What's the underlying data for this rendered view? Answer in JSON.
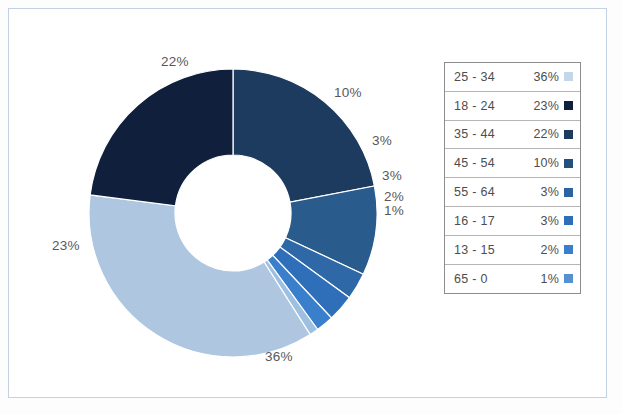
{
  "chart_data": {
    "type": "pie",
    "variant": "donut",
    "title": "",
    "subtitle": "",
    "xlabel": "",
    "ylabel": "",
    "legend_position": "right",
    "grid": false,
    "start_angle_deg": 0,
    "direction": "clockwise",
    "categories": [
      "25 - 34",
      "18 - 24",
      "35 - 44",
      "45 - 54",
      "55 - 64",
      "16 - 17",
      "13 - 15",
      "65 - 0"
    ],
    "values": [
      36,
      23,
      22,
      10,
      3,
      3,
      2,
      1
    ],
    "unit": "%",
    "draw_order": [
      "35 - 44",
      "45 - 54",
      "55 - 64",
      "16 - 17",
      "13 - 15",
      "65 - 0",
      "25 - 34",
      "18 - 24"
    ],
    "slices": [
      {
        "label": "35 - 44",
        "value": 22,
        "display": "22%",
        "color": "#1d3a5f"
      },
      {
        "label": "45 - 54",
        "value": 10,
        "display": "10%",
        "color": "#2a5b8d"
      },
      {
        "label": "55 - 64",
        "value": 3,
        "display": "3%",
        "color": "#2e68a6"
      },
      {
        "label": "16 - 17",
        "value": 3,
        "display": "3%",
        "color": "#2f6fba"
      },
      {
        "label": "13 - 15",
        "value": 2,
        "display": "2%",
        "color": "#3a7fcc"
      },
      {
        "label": "65 - 0",
        "value": 1,
        "display": "1%",
        "color": "#9dc0e2"
      },
      {
        "label": "25 - 34",
        "value": 36,
        "display": "36%",
        "color": "#aec6e0"
      },
      {
        "label": "18 - 24",
        "value": 23,
        "display": "23%",
        "color": "#101f3c"
      }
    ]
  },
  "donut": {
    "center_x": 233,
    "center_y": 213,
    "outer_radius": 144,
    "inner_radius": 58,
    "hole_color": "#ffffff",
    "separator_color": "#ffffff",
    "labels": [
      {
        "name": "label-22",
        "text": "22%",
        "x": 161,
        "y": 54
      },
      {
        "name": "label-10",
        "text": "10%",
        "x": 334,
        "y": 85
      },
      {
        "name": "label-3a",
        "text": "3%",
        "x": 372,
        "y": 133
      },
      {
        "name": "label-3b",
        "text": "3%",
        "x": 382,
        "y": 168
      },
      {
        "name": "label-2",
        "text": "2%",
        "x": 384,
        "y": 189
      },
      {
        "name": "label-1",
        "text": "1%",
        "x": 384,
        "y": 203
      },
      {
        "name": "label-23",
        "text": "23%",
        "x": 52,
        "y": 238
      },
      {
        "name": "label-36",
        "text": "36%",
        "x": 265,
        "y": 349
      }
    ]
  },
  "legend": {
    "rows": [
      {
        "label": "25 - 34",
        "value": "36%",
        "color": "#c4d7ea"
      },
      {
        "label": "18 - 24",
        "value": "23%",
        "color": "#101f3c"
      },
      {
        "label": "35 - 44",
        "value": "22%",
        "color": "#1d3a5f"
      },
      {
        "label": "45 - 54",
        "value": "10%",
        "color": "#24507f"
      },
      {
        "label": "55 - 64",
        "value": "3%",
        "color": "#2b63a3"
      },
      {
        "label": "16 - 17",
        "value": "3%",
        "color": "#2f6fba"
      },
      {
        "label": "13 - 15",
        "value": "2%",
        "color": "#3a7fcc"
      },
      {
        "label": "65 - 0",
        "value": "1%",
        "color": "#5590d2"
      }
    ]
  },
  "frame": {
    "border_color": "#c3d2e2",
    "background": "#ffffff"
  }
}
